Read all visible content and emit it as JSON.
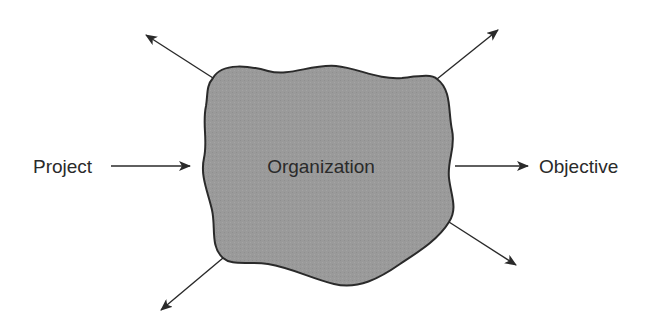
{
  "diagram": {
    "center": {
      "label": "Organization",
      "fill": "#9a9a9a",
      "stroke": "#2a2a2a"
    },
    "input": {
      "label": "Project"
    },
    "output": {
      "label": "Objective"
    },
    "arrows": [
      {
        "name": "input-arrow",
        "direction": "in",
        "from": "Project",
        "to": "Organization"
      },
      {
        "name": "output-arrow",
        "direction": "out",
        "from": "Organization",
        "to": "Objective"
      },
      {
        "name": "upper-left-arrow",
        "direction": "out",
        "label": ""
      },
      {
        "name": "upper-right-arrow",
        "direction": "out",
        "label": ""
      },
      {
        "name": "lower-right-arrow",
        "direction": "out",
        "label": ""
      },
      {
        "name": "lower-left-arrow",
        "direction": "out",
        "label": ""
      }
    ],
    "colors": {
      "line": "#2a2a2a",
      "blob_fill": "#9a9a9a",
      "background": "#ffffff"
    }
  }
}
